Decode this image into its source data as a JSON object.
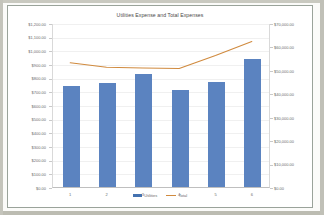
{
  "chart": {
    "title": "Utilities Expense and Total Expenses",
    "legend": [
      {
        "label": "Utilities",
        "marker": "bar-swatch-blue"
      },
      {
        "label": "Total",
        "marker": "line-swatch-orange"
      }
    ],
    "colors": {
      "bar": "#5b83c0",
      "line": "#d08a3e",
      "frame": "#9aa39a",
      "grid": "#f0f0f0",
      "text": "#6b6b6b",
      "plot_background": "#ffffff",
      "page_background": "#fbfbf9"
    }
  },
  "chart_data": {
    "type": "bar",
    "title": "Utilities Expense and Total Expenses",
    "xlabel": "",
    "ylabel": "",
    "categories": [
      "1",
      "2",
      "3",
      "4",
      "5",
      "6"
    ],
    "grid": true,
    "legend_position": "bottom",
    "series": [
      {
        "name": "Utilities",
        "type": "bar",
        "axis": "left",
        "values": [
          740,
          760,
          830,
          710,
          765,
          940
        ]
      },
      {
        "name": "Total",
        "type": "line",
        "axis": "right",
        "values": [
          53500,
          51500,
          51200,
          51000,
          56500,
          62500
        ]
      }
    ],
    "left_axis": {
      "ylim": [
        0,
        1200
      ],
      "step": 100,
      "ticks": [
        "$1,200.00",
        "$1,100.00",
        "$1,000.00",
        "$900.00",
        "$800.00",
        "$700.00",
        "$600.00",
        "$500.00",
        "$400.00",
        "$300.00",
        "$200.00",
        "$100.00",
        "$0.00"
      ]
    },
    "right_axis": {
      "ylim": [
        0,
        70000
      ],
      "step": 10000,
      "ticks": [
        "$70,000.00",
        "$60,000.00",
        "$50,000.00",
        "$40,000.00",
        "$30,000.00",
        "$20,000.00",
        "$10,000.00",
        "$0.00"
      ]
    }
  }
}
